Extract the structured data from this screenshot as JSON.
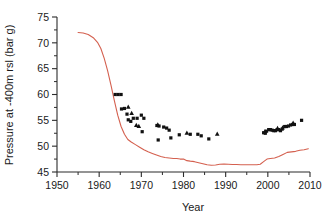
{
  "chart_data": {
    "type": "scatter",
    "title": "",
    "xlabel": "Year",
    "ylabel": "Pressure at -400m rsl (bar g)",
    "xlim": [
      1950,
      2010
    ],
    "ylim": [
      45,
      75
    ],
    "xticks": [
      1950,
      1960,
      1970,
      1980,
      1990,
      2000,
      2010
    ],
    "yticks": [
      45,
      50,
      55,
      60,
      65,
      70,
      75
    ],
    "xminor_step": 5,
    "yminor_step": 2.5,
    "grid": false,
    "legend": "none",
    "series": [
      {
        "name": "Modelled reservoir pressure",
        "type": "line",
        "color": "#d4604f",
        "points": [
          [
            1955.0,
            72.0
          ],
          [
            1956.2,
            71.9
          ],
          [
            1957.4,
            71.6
          ],
          [
            1958.6,
            71.0
          ],
          [
            1959.6,
            70.1
          ],
          [
            1960.4,
            68.9
          ],
          [
            1961.2,
            67.0
          ],
          [
            1962.0,
            64.6
          ],
          [
            1962.8,
            61.8
          ],
          [
            1963.6,
            58.8
          ],
          [
            1964.4,
            56.0
          ],
          [
            1965.2,
            53.8
          ],
          [
            1966.0,
            52.3
          ],
          [
            1966.8,
            51.3
          ],
          [
            1967.6,
            50.8
          ],
          [
            1968.6,
            50.3
          ],
          [
            1969.6,
            49.8
          ],
          [
            1970.6,
            49.3
          ],
          [
            1971.6,
            48.9
          ],
          [
            1972.6,
            48.6
          ],
          [
            1973.6,
            48.3
          ],
          [
            1974.6,
            48.0
          ],
          [
            1975.6,
            47.8
          ],
          [
            1976.6,
            47.7
          ],
          [
            1977.6,
            47.6
          ],
          [
            1978.4,
            47.6
          ],
          [
            1979.2,
            47.5
          ],
          [
            1980.0,
            47.5
          ],
          [
            1980.8,
            47.2
          ],
          [
            1981.6,
            47.1
          ],
          [
            1982.6,
            47.0
          ],
          [
            1983.6,
            46.8
          ],
          [
            1984.6,
            46.6
          ],
          [
            1985.6,
            46.4
          ],
          [
            1986.6,
            46.3
          ],
          [
            1987.6,
            46.35
          ],
          [
            1988.6,
            46.5
          ],
          [
            1989.6,
            46.55
          ],
          [
            1990.6,
            46.5
          ],
          [
            1991.6,
            46.45
          ],
          [
            1992.6,
            46.45
          ],
          [
            1993.6,
            46.4
          ],
          [
            1994.6,
            46.4
          ],
          [
            1995.6,
            46.4
          ],
          [
            1996.6,
            46.4
          ],
          [
            1997.4,
            46.4
          ],
          [
            1998.2,
            46.5
          ],
          [
            1999.0,
            47.0
          ],
          [
            1999.8,
            47.5
          ],
          [
            2000.6,
            47.6
          ],
          [
            2001.6,
            47.7
          ],
          [
            2002.6,
            48.0
          ],
          [
            2003.6,
            48.4
          ],
          [
            2004.6,
            48.8
          ],
          [
            2005.6,
            48.9
          ],
          [
            2006.6,
            49.0
          ],
          [
            2007.6,
            49.2
          ],
          [
            2008.6,
            49.3
          ],
          [
            2009.6,
            49.5
          ]
        ]
      },
      {
        "name": "Measured pressure (square markers)",
        "type": "scatter",
        "marker": "square",
        "color": "#111111",
        "points": [
          [
            1963.8,
            60.0
          ],
          [
            1964.5,
            60.0
          ],
          [
            1965.2,
            60.0
          ],
          [
            1965.3,
            57.2
          ],
          [
            1966.0,
            57.3
          ],
          [
            1966.6,
            56.2
          ],
          [
            1966.9,
            55.1
          ],
          [
            1967.5,
            54.8
          ],
          [
            1968.1,
            55.4
          ],
          [
            1969.0,
            55.4
          ],
          [
            1970.0,
            56.0
          ],
          [
            1970.6,
            55.4
          ],
          [
            1970.2,
            52.8
          ],
          [
            1973.7,
            54.0
          ],
          [
            1974.2,
            53.9
          ],
          [
            1974.0,
            51.2
          ],
          [
            1975.3,
            53.7
          ],
          [
            1976.0,
            53.5
          ],
          [
            1976.6,
            53.1
          ],
          [
            1977.0,
            51.6
          ],
          [
            1979.0,
            52.2
          ],
          [
            1981.6,
            52.3
          ],
          [
            1983.4,
            52.3
          ],
          [
            1984.2,
            52.0
          ],
          [
            1986.0,
            51.4
          ],
          [
            1999.0,
            52.6
          ],
          [
            1999.4,
            52.5
          ],
          [
            1999.7,
            52.9
          ],
          [
            2000.2,
            53.2
          ],
          [
            2000.6,
            53.2
          ],
          [
            2001.0,
            53.1
          ],
          [
            2001.4,
            53.0
          ],
          [
            2001.8,
            53.0
          ],
          [
            2002.2,
            53.2
          ],
          [
            2002.6,
            53.2
          ],
          [
            2003.0,
            53.0
          ],
          [
            2003.4,
            53.3
          ],
          [
            2004.0,
            53.8
          ],
          [
            2004.4,
            53.8
          ],
          [
            2004.9,
            53.9
          ],
          [
            2005.4,
            54.1
          ],
          [
            2005.9,
            54.2
          ],
          [
            2006.3,
            54.2
          ],
          [
            2008.0,
            55.0
          ]
        ]
      },
      {
        "name": "Measured pressure (triangle markers)",
        "type": "scatter",
        "marker": "triangle",
        "color": "#111111",
        "points": [
          [
            1966.9,
            57.6
          ],
          [
            1967.7,
            56.4
          ],
          [
            1968.8,
            54.1
          ],
          [
            1969.4,
            53.9
          ],
          [
            1973.9,
            54.2
          ],
          [
            1980.8,
            52.6
          ],
          [
            1988.0,
            52.4
          ],
          [
            1999.3,
            52.9
          ],
          [
            2002.3,
            53.5
          ],
          [
            2003.5,
            53.6
          ],
          [
            2006.0,
            54.5
          ]
        ]
      }
    ]
  },
  "layout": {
    "plot_left_px": 57,
    "plot_right_px": 310,
    "plot_top_px": 17,
    "plot_bottom_px": 172
  }
}
